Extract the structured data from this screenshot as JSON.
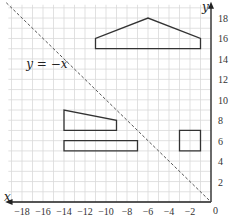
{
  "diagram": {
    "type": "coordinate_grid",
    "axes": {
      "x_label": "x",
      "y_label": "y",
      "origin_label": "0",
      "x_range": [
        -19,
        0
      ],
      "y_range": [
        0,
        19
      ],
      "x_ticks": [
        -18,
        -16,
        -14,
        -12,
        -10,
        -8,
        -6,
        -4,
        -2
      ],
      "x_tick_labels": [
        "−18",
        "−16",
        "−14",
        "−12",
        "−10",
        "−8",
        "−6",
        "−4",
        "−2"
      ],
      "y_ticks": [
        2,
        4,
        6,
        8,
        10,
        12,
        14,
        16,
        18
      ],
      "y_tick_labels": [
        "2",
        "4",
        "6",
        "8",
        "10",
        "12",
        "14",
        "16",
        "18"
      ],
      "grid": true
    },
    "line": {
      "label": "y = −x",
      "style": "dashed",
      "from": [
        -19.5,
        19.5
      ],
      "to": [
        0,
        0
      ]
    },
    "shapes": [
      {
        "name": "pentagon-house",
        "points": [
          [
            -11,
            15
          ],
          [
            -11,
            16
          ],
          [
            -6,
            18
          ],
          [
            -1,
            16
          ],
          [
            -1,
            15
          ]
        ]
      },
      {
        "name": "trapezoid",
        "points": [
          [
            -14,
            7
          ],
          [
            -14,
            9
          ],
          [
            -9,
            8
          ],
          [
            -9,
            7
          ]
        ]
      },
      {
        "name": "long-rectangle",
        "points": [
          [
            -14,
            5
          ],
          [
            -14,
            6
          ],
          [
            -7,
            6
          ],
          [
            -7,
            5
          ]
        ]
      },
      {
        "name": "square",
        "points": [
          [
            -3,
            5
          ],
          [
            -3,
            7
          ],
          [
            -1,
            7
          ],
          [
            -1,
            5
          ]
        ]
      }
    ],
    "colors": {
      "grid": "#d9d9d9",
      "axis": "#222222",
      "shape_stroke": "#333333",
      "dashed_line": "#555555"
    }
  }
}
